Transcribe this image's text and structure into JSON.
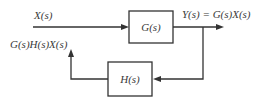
{
  "diagram": {
    "type": "feedback-block-diagram",
    "input": {
      "label": "X(s)"
    },
    "forward_block": {
      "label": "G(s)"
    },
    "output": {
      "label": "Y(s) = G(s)X(s)"
    },
    "feedback_block": {
      "label": "H(s)"
    },
    "feedback_signal": {
      "label": "G(s)H(s)X(s)"
    },
    "colors": {
      "line": "#333333",
      "text": "#3a3a3a",
      "background": "#ffffff"
    }
  }
}
